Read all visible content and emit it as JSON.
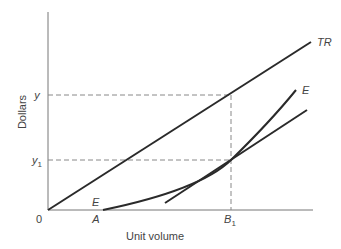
{
  "diagram": {
    "type": "economics-breakeven-diagram",
    "axes": {
      "y_label": "Dollars",
      "x_label": "Unit volume",
      "origin_label": "0"
    },
    "y_ticks": [
      {
        "label": "y",
        "sub": ""
      },
      {
        "label": "y",
        "sub": "1"
      }
    ],
    "x_ticks": [
      {
        "label": "A",
        "sub": ""
      },
      {
        "label": "B",
        "sub": "1"
      }
    ],
    "curves": [
      {
        "name": "total-revenue-line",
        "label": "TR"
      },
      {
        "name": "expense-curve",
        "label": "E",
        "start_label": "E"
      },
      {
        "name": "tangent-line",
        "label": ""
      }
    ],
    "colors": {
      "line": "#2a2a2a",
      "axis": "#777777",
      "dashed": "#888888",
      "text": "#444444"
    }
  }
}
